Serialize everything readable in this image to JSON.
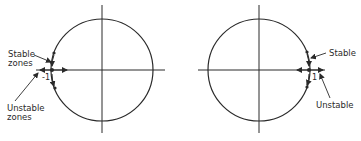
{
  "figure": {
    "left_panel": {
      "labels": {
        "stable": [
          "Stable",
          "zones"
        ],
        "unstable": [
          "Unstable",
          "zones"
        ],
        "point": "-1"
      }
    },
    "right_panel": {
      "labels": {
        "stable": "Stable",
        "unstable": "Unstable",
        "point": "1"
      }
    },
    "colors": {
      "stroke": "#2a2a2a",
      "background": "#ffffff"
    }
  }
}
